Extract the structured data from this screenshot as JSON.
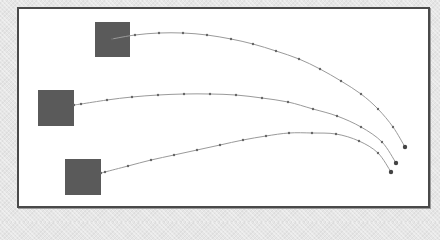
{
  "diagram": {
    "frame": {
      "x": 17,
      "y": 7,
      "width": 413,
      "height": 201,
      "border_color": "#4a4a4a",
      "fill": "#ffffff"
    },
    "colors": {
      "square": "#5a5a5a",
      "curve": "#9a9a9a",
      "dot": "#666666",
      "endpoint": "#444444"
    },
    "squares": [
      {
        "id": "square-1",
        "x": 95,
        "y": 22,
        "size": 35
      },
      {
        "id": "square-2",
        "x": 38,
        "y": 90,
        "size": 36
      },
      {
        "id": "square-3",
        "x": 65,
        "y": 159,
        "size": 36
      }
    ],
    "trajectories": [
      {
        "id": "trajectory-1",
        "points": [
          [
            112,
            39
          ],
          [
            135,
            35
          ],
          [
            159,
            33
          ],
          [
            183,
            33
          ],
          [
            207,
            35
          ],
          [
            231,
            39
          ],
          [
            253,
            44
          ],
          [
            276,
            51
          ],
          [
            299,
            59
          ],
          [
            320,
            69
          ],
          [
            341,
            81
          ],
          [
            361,
            94
          ],
          [
            378,
            109
          ],
          [
            393,
            127
          ],
          [
            405,
            147
          ]
        ]
      },
      {
        "id": "trajectory-2",
        "points": [
          [
            74,
            105
          ],
          [
            81,
            104
          ],
          [
            107,
            100
          ],
          [
            132,
            97
          ],
          [
            158,
            95
          ],
          [
            184,
            94
          ],
          [
            210,
            94
          ],
          [
            236,
            95
          ],
          [
            262,
            98
          ],
          [
            288,
            102
          ],
          [
            313,
            109
          ],
          [
            337,
            116
          ],
          [
            361,
            127
          ],
          [
            382,
            142
          ],
          [
            396,
            163
          ]
        ]
      },
      {
        "id": "trajectory-3",
        "points": [
          [
            101,
            173
          ],
          [
            105,
            172
          ],
          [
            128,
            166
          ],
          [
            151,
            160
          ],
          [
            174,
            155
          ],
          [
            197,
            150
          ],
          [
            220,
            145
          ],
          [
            243,
            140
          ],
          [
            266,
            136
          ],
          [
            289,
            133
          ],
          [
            312,
            133
          ],
          [
            336,
            134
          ],
          [
            359,
            141
          ],
          [
            378,
            153
          ],
          [
            391,
            172
          ]
        ]
      }
    ]
  }
}
